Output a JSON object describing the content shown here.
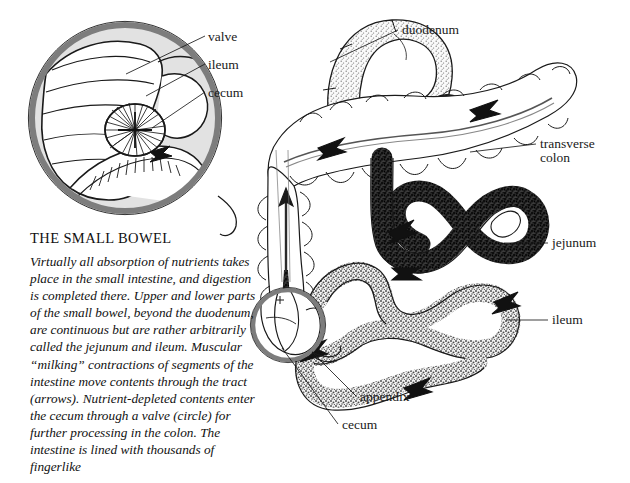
{
  "figure": {
    "title": "THE SMALL BOWEL",
    "body": "Virtually all absorption of nutrients takes place in the small intestine, and digestion is completed there. Upper and lower parts of the small bowel, beyond the duodenum, are continuous but are rather arbitrarily called the jejunum and ileum. Muscular “milking” contractions of segments of the intestine move contents through the tract (arrows).\nNutrient-depleted contents enter the cecum through a valve (circle) for further processing in the colon. The intestine is lined with thousands of fingerlike"
  },
  "labels": {
    "valve": "valve",
    "ileum_inset": "ileum",
    "cecum_inset": "cecum",
    "duodenum": "duodenum",
    "transverse_colon_line1": "transverse",
    "transverse_colon_line2": "colon",
    "jejunum": "jejunum",
    "ileum": "ileum",
    "appendix": "appendix",
    "cecum": "cecum"
  },
  "colors": {
    "ink": "#1a1a1a",
    "inset_ring": "#7d7d7d",
    "inset_fill": "#e2e2e2",
    "jejunum_fill": "#2b2b2b",
    "ileum_fill": "#b9b9b9",
    "duodenum_fill": "#d8d8d8",
    "background": "#ffffff"
  }
}
